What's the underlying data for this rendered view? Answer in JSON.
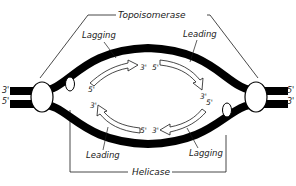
{
  "enzymes": {
    "top": "Topoisomerase",
    "bottom": "Helicase"
  },
  "strand_labels": {
    "top_left": "Lagging",
    "top_right": "Leading",
    "bottom_left": "Leading",
    "bottom_right": "Lagging"
  },
  "ends": {
    "left_top": "3'",
    "left_bottom": "5'",
    "right_top": "5'",
    "right_bottom": "3'"
  },
  "arrow_ends": {
    "top_left_start": "5'",
    "top_left_end": "3'",
    "top_right_start": "5'",
    "top_right_end": "3'",
    "bottom_left_end": "3'",
    "bottom_left_start": "5'",
    "bottom_right_start": "5'",
    "bottom_right_end": "3'"
  },
  "colors": {
    "strand": "#000000",
    "line": "#1a1a1a",
    "background": "#ffffff"
  }
}
